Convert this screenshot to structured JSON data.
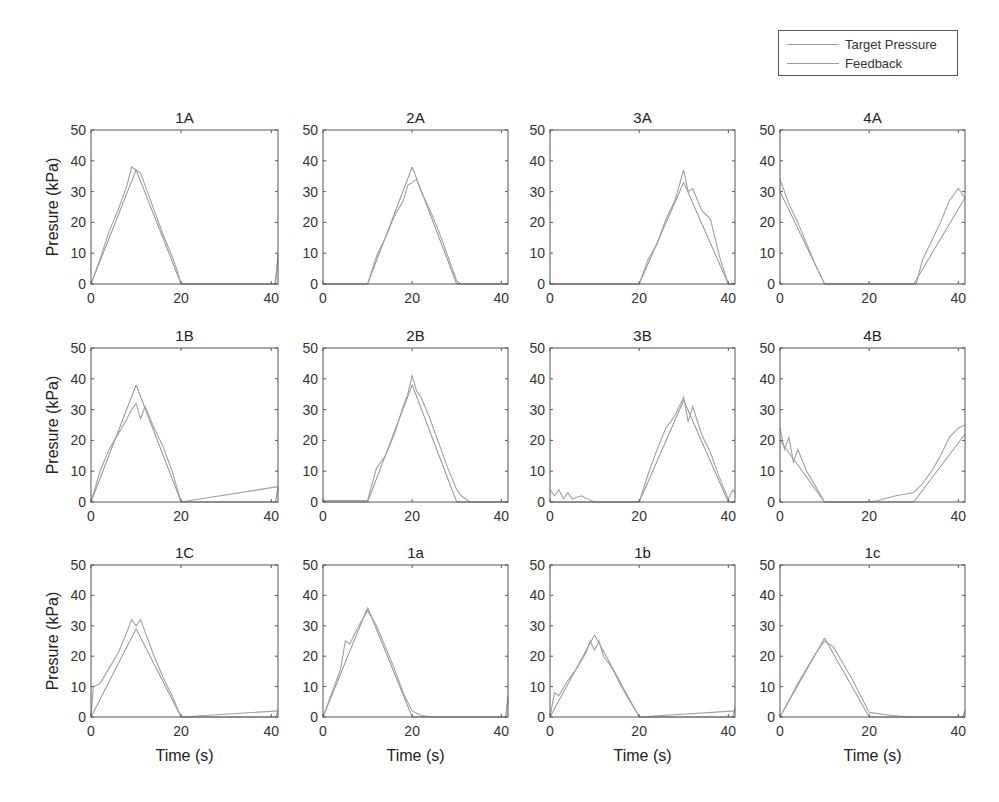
{
  "figure": {
    "legend": {
      "items": [
        {
          "label": "Target Pressure",
          "color": "#8c8c8c"
        },
        {
          "label": "Feedback",
          "color": "#a8a8a8"
        }
      ]
    },
    "ylabel": "Presure (kPa)",
    "xlabel": "Time (s)",
    "yticks": [
      "0",
      "10",
      "20",
      "30",
      "40",
      "50"
    ],
    "xticks": [
      "0",
      "20",
      "40"
    ]
  },
  "chart_data": [
    {
      "type": "line",
      "title": "1A",
      "xlabel": "",
      "ylabel": "Presure (kPa)",
      "xlim": [
        0,
        41.5
      ],
      "ylim": [
        0,
        50
      ],
      "grid": false,
      "series": [
        {
          "name": "Target Pressure",
          "x": [
            0,
            10,
            20,
            40.8,
            41.5
          ],
          "y": [
            0,
            37,
            0,
            0,
            8
          ]
        },
        {
          "name": "Feedback",
          "x": [
            0,
            2,
            4,
            6,
            8,
            9,
            10,
            11,
            12,
            14,
            16,
            18,
            19,
            20,
            41,
            41.5
          ],
          "y": [
            0,
            8,
            17,
            24,
            32,
            38,
            37,
            36,
            32,
            24,
            16,
            9,
            5,
            0,
            0,
            10
          ]
        }
      ]
    },
    {
      "type": "line",
      "title": "2A",
      "xlabel": "",
      "ylabel": "",
      "xlim": [
        0,
        41.5
      ],
      "ylim": [
        0,
        50
      ],
      "grid": false,
      "series": [
        {
          "name": "Target Pressure",
          "x": [
            0,
            10,
            20,
            30,
            41.5
          ],
          "y": [
            0,
            0,
            38,
            0,
            0
          ]
        },
        {
          "name": "Feedback",
          "x": [
            0,
            10,
            12,
            14,
            16,
            18,
            19,
            20,
            21,
            22,
            24,
            26,
            28,
            30,
            31,
            41.5
          ],
          "y": [
            0,
            0,
            9,
            15,
            22,
            27,
            32,
            33,
            34,
            30,
            24,
            17,
            9,
            1,
            0,
            0
          ]
        }
      ]
    },
    {
      "type": "line",
      "title": "3A",
      "xlabel": "",
      "ylabel": "",
      "xlim": [
        0,
        41.5
      ],
      "ylim": [
        0,
        50
      ],
      "grid": false,
      "series": [
        {
          "name": "Target Pressure",
          "x": [
            0,
            20,
            30,
            40,
            41.5
          ],
          "y": [
            0,
            0,
            33,
            0,
            0
          ]
        },
        {
          "name": "Feedback",
          "x": [
            0,
            20,
            22,
            24,
            26,
            28,
            30,
            31,
            32,
            34,
            36,
            38,
            40,
            41.5
          ],
          "y": [
            0,
            0,
            8,
            13,
            21,
            27,
            37,
            30,
            31,
            24,
            21,
            9,
            0,
            0
          ]
        }
      ]
    },
    {
      "type": "line",
      "title": "4A",
      "xlabel": "",
      "ylabel": "",
      "xlim": [
        0,
        41.5
      ],
      "ylim": [
        0,
        50
      ],
      "grid": false,
      "series": [
        {
          "name": "Target Pressure",
          "x": [
            0,
            10,
            30,
            41.5
          ],
          "y": [
            30,
            0,
            0,
            28
          ]
        },
        {
          "name": "Feedback",
          "x": [
            0,
            2,
            4,
            6,
            8,
            10,
            30.5,
            32,
            34,
            36,
            38,
            40,
            41.5
          ],
          "y": [
            34,
            26,
            20,
            13,
            6,
            0,
            0,
            8,
            14,
            20,
            27,
            31,
            28
          ]
        }
      ]
    },
    {
      "type": "line",
      "title": "1B",
      "xlabel": "",
      "ylabel": "Presure (kPa)",
      "xlim": [
        0,
        41.5
      ],
      "ylim": [
        0,
        50
      ],
      "grid": false,
      "series": [
        {
          "name": "Target Pressure",
          "x": [
            0,
            10,
            20,
            41,
            41.5
          ],
          "y": [
            0,
            38,
            0,
            0,
            5
          ]
        },
        {
          "name": "Feedback",
          "x": [
            0,
            2,
            4,
            6,
            8,
            9,
            10,
            11,
            12,
            14,
            16,
            18,
            20,
            41.5
          ],
          "y": [
            0,
            10,
            17,
            22,
            27,
            30,
            32,
            27,
            31,
            24,
            18,
            10,
            0,
            5
          ]
        }
      ]
    },
    {
      "type": "line",
      "title": "2B",
      "xlabel": "",
      "ylabel": "",
      "xlim": [
        0,
        41.5
      ],
      "ylim": [
        0,
        50
      ],
      "grid": false,
      "series": [
        {
          "name": "Target Pressure",
          "x": [
            0,
            10,
            20,
            30,
            41.5
          ],
          "y": [
            0,
            0,
            38,
            0,
            0
          ]
        },
        {
          "name": "Feedback",
          "x": [
            0,
            10,
            12,
            14,
            16,
            18,
            19,
            20,
            21,
            22,
            24,
            26,
            28,
            30,
            31,
            33,
            41.5
          ],
          "y": [
            0.5,
            0.5,
            11,
            15,
            22,
            31,
            35,
            41,
            36,
            34,
            27,
            19,
            11,
            4,
            2,
            0,
            0
          ]
        }
      ]
    },
    {
      "type": "line",
      "title": "3B",
      "xlabel": "",
      "ylabel": "",
      "xlim": [
        0,
        41.5
      ],
      "ylim": [
        0,
        50
      ],
      "grid": false,
      "series": [
        {
          "name": "Target Pressure",
          "x": [
            0,
            20,
            30,
            40,
            41.5
          ],
          "y": [
            0,
            0,
            33,
            0,
            0
          ]
        },
        {
          "name": "Feedback",
          "x": [
            0,
            1,
            2,
            3,
            4,
            5,
            7,
            10,
            20,
            22,
            24,
            26,
            28,
            30,
            31,
            32,
            34,
            36,
            38,
            40,
            41,
            41.5
          ],
          "y": [
            4,
            2,
            4,
            1,
            3,
            1,
            2,
            0,
            0,
            9,
            17,
            24,
            28,
            34,
            26,
            31,
            22,
            16,
            8,
            1,
            4,
            3
          ]
        }
      ]
    },
    {
      "type": "line",
      "title": "4B",
      "xlabel": "",
      "ylabel": "",
      "xlim": [
        0,
        41.5
      ],
      "ylim": [
        0,
        50
      ],
      "grid": false,
      "series": [
        {
          "name": "Target Pressure",
          "x": [
            0,
            10,
            30,
            41.5
          ],
          "y": [
            20,
            0,
            0,
            22
          ]
        },
        {
          "name": "Feedback",
          "x": [
            0,
            1,
            2,
            3,
            4,
            6,
            8,
            10,
            20,
            22,
            26,
            30,
            32,
            34,
            36,
            38,
            40,
            41.5
          ],
          "y": [
            24,
            17,
            21,
            13,
            17,
            10,
            5,
            0,
            0,
            0.5,
            2,
            3,
            6,
            10,
            15,
            21,
            24,
            25
          ]
        }
      ]
    },
    {
      "type": "line",
      "title": "1C",
      "xlabel": "Time (s)",
      "ylabel": "Presure (kPa)",
      "xlim": [
        0,
        41.5
      ],
      "ylim": [
        0,
        50
      ],
      "grid": false,
      "series": [
        {
          "name": "Target Pressure",
          "x": [
            0,
            10,
            20,
            41,
            41.5
          ],
          "y": [
            0,
            29,
            0,
            0,
            2
          ]
        },
        {
          "name": "Feedback",
          "x": [
            0,
            0.5,
            2,
            4,
            6,
            8,
            9,
            10,
            11,
            12,
            14,
            16,
            18,
            20,
            41.5
          ],
          "y": [
            0,
            10,
            11,
            16,
            21,
            28,
            32,
            30,
            32,
            28,
            20,
            13,
            7,
            0,
            2
          ]
        }
      ]
    },
    {
      "type": "line",
      "title": "1a",
      "xlabel": "Time (s)",
      "ylabel": "",
      "xlim": [
        0,
        41.5
      ],
      "ylim": [
        0,
        50
      ],
      "grid": false,
      "series": [
        {
          "name": "Target Pressure",
          "x": [
            0,
            10,
            20,
            41,
            41.5
          ],
          "y": [
            0,
            36,
            0,
            0,
            7
          ]
        },
        {
          "name": "Feedback",
          "x": [
            0,
            2,
            4,
            5,
            6,
            8,
            10,
            12,
            14,
            16,
            18,
            20,
            22,
            25,
            41,
            41.5
          ],
          "y": [
            0,
            8,
            16,
            25,
            24,
            30,
            35,
            30,
            23,
            16,
            8,
            2,
            0.5,
            0,
            0,
            6
          ]
        }
      ]
    },
    {
      "type": "line",
      "title": "1b",
      "xlabel": "Time (s)",
      "ylabel": "",
      "xlim": [
        0,
        41.5
      ],
      "ylim": [
        0,
        50
      ],
      "grid": false,
      "series": [
        {
          "name": "Target Pressure",
          "x": [
            0,
            10,
            20,
            41,
            41.5
          ],
          "y": [
            0,
            27,
            0,
            0,
            3
          ]
        },
        {
          "name": "Feedback",
          "x": [
            0,
            1,
            2,
            4,
            6,
            8,
            9,
            10,
            11,
            12,
            14,
            16,
            18,
            20,
            41.5
          ],
          "y": [
            0,
            8,
            7,
            12,
            16,
            21,
            25,
            22,
            25,
            20,
            16,
            10,
            5,
            0,
            2
          ]
        }
      ]
    },
    {
      "type": "line",
      "title": "1c",
      "xlabel": "Time (s)",
      "ylabel": "",
      "xlim": [
        0,
        41.5
      ],
      "ylim": [
        0,
        50
      ],
      "grid": false,
      "series": [
        {
          "name": "Target Pressure",
          "x": [
            0,
            10,
            20,
            41,
            41.5
          ],
          "y": [
            0,
            26,
            0,
            0,
            2
          ]
        },
        {
          "name": "Feedback",
          "x": [
            0,
            4,
            8,
            10,
            12,
            16,
            20,
            25,
            30,
            41,
            41.5
          ],
          "y": [
            0,
            11,
            21,
            25,
            23,
            13,
            1.5,
            0.5,
            0,
            0,
            2
          ]
        }
      ]
    }
  ]
}
